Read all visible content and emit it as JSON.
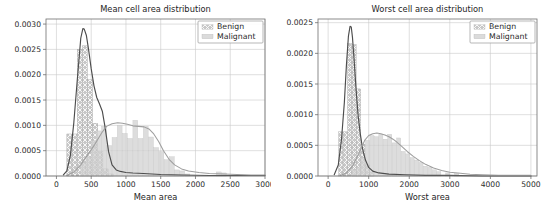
{
  "figure": {
    "background": "#ffffff",
    "grid": true,
    "legend_position": "upper right"
  },
  "colors": {
    "benign": "#9a9a9a",
    "benign_line": "#4d4d4d",
    "malignant": "#d2d2d2",
    "malignant_line": "#9e9e9e",
    "grid": "#c9c9c9",
    "axis": "#6f6f6f",
    "text": "#262626"
  },
  "legend": {
    "items": [
      {
        "label": "Benign",
        "color": "#9a9a9a",
        "hatch": "xx"
      },
      {
        "label": "Malignant",
        "color": "#d2d2d2",
        "hatch": ""
      }
    ]
  },
  "chart_data": [
    {
      "id": "mean-area",
      "type": "bar",
      "title": "Mean cell area distribution",
      "xlabel": "Mean area",
      "ylabel": "",
      "xlim": [
        -150,
        3000
      ],
      "ylim": [
        0.0,
        0.0031
      ],
      "xticks": [
        0,
        500,
        1000,
        1500,
        2000,
        2500,
        3000
      ],
      "xticklabels": [
        "0",
        "500",
        "1000",
        "1500",
        "2000",
        "2500",
        "3000"
      ],
      "yticks": [
        0.0,
        0.0005,
        0.001,
        0.0015,
        0.002,
        0.0025,
        0.003
      ],
      "yticklabels": [
        "0.0000",
        "0.0005",
        "0.0010",
        "0.0015",
        "0.0020",
        "0.0025",
        "0.0030"
      ],
      "bin_width": 75,
      "series": [
        {
          "name": "Benign",
          "kind": "histogram",
          "bin_starts": [
            150,
            225,
            300,
            375,
            450,
            525,
            600,
            675,
            750
          ],
          "values": [
            0.00083,
            0.00083,
            0.0025,
            0.00257,
            0.0019,
            0.00104,
            0.00048,
            0.00014,
            4e-05
          ],
          "kde_x": [
            100,
            150,
            200,
            250,
            300,
            350,
            380,
            400,
            430,
            460,
            500,
            540,
            580,
            620,
            660,
            700,
            750,
            800,
            860,
            920,
            1000,
            1100,
            1250,
            1500,
            1800,
            2200,
            2600,
            3000
          ],
          "kde_y": [
            2e-05,
            0.0001,
            0.0004,
            0.00105,
            0.0019,
            0.00272,
            0.00291,
            0.0029,
            0.00278,
            0.00252,
            0.00212,
            0.00178,
            0.00155,
            0.00142,
            0.00128,
            0.00096,
            0.00048,
            0.00022,
            0.00012,
            9e-05,
            7e-05,
            6e-05,
            5e-05,
            3e-05,
            2e-05,
            1e-05,
            1e-05,
            1e-05
          ]
        },
        {
          "name": "Malignant",
          "kind": "histogram",
          "bin_starts": [
            350,
            425,
            500,
            575,
            650,
            725,
            800,
            875,
            950,
            1025,
            1100,
            1175,
            1250,
            1325,
            1400,
            1475,
            1550,
            1625,
            1700,
            1775,
            1850,
            2300,
            2375
          ],
          "values": [
            0.00026,
            0.00038,
            0.0007,
            0.00089,
            0.00098,
            0.0006,
            0.00076,
            0.001,
            0.00084,
            0.00074,
            0.0011,
            0.00074,
            0.00098,
            0.00077,
            0.00056,
            0.00048,
            0.00032,
            0.00038,
            0.00012,
            0.0001,
            4e-05,
            8e-05,
            6e-05
          ],
          "kde_x": [
            150,
            250,
            350,
            450,
            550,
            650,
            720,
            800,
            880,
            950,
            1020,
            1100,
            1180,
            1260,
            1330,
            1400,
            1470,
            1540,
            1620,
            1700,
            1800,
            1900,
            2050,
            2200,
            2400,
            2600,
            2800,
            3000
          ],
          "kde_y": [
            1e-05,
            8e-05,
            0.00022,
            0.00042,
            0.00062,
            0.00085,
            0.00098,
            0.00103,
            0.00105,
            0.00104,
            0.00102,
            0.00099,
            0.00098,
            0.00097,
            0.00093,
            0.00083,
            0.00068,
            0.0005,
            0.00033,
            0.00022,
            0.00014,
            0.0001,
            7e-05,
            5e-05,
            4e-05,
            3e-05,
            2e-05,
            2e-05
          ]
        }
      ]
    },
    {
      "id": "worst-area",
      "type": "bar",
      "title": "Worst cell area distribution",
      "xlabel": "Worst area",
      "ylabel": "",
      "xlim": [
        -250,
        5150
      ],
      "ylim": [
        0.0,
        0.00256
      ],
      "xticks": [
        0,
        1000,
        2000,
        3000,
        4000,
        5000
      ],
      "xticklabels": [
        "0",
        "1000",
        "2000",
        "3000",
        "4000",
        "5000"
      ],
      "yticks": [
        0.0,
        0.0005,
        0.001,
        0.0015,
        0.002,
        0.0025
      ],
      "yticklabels": [
        "0.0000",
        "0.0005",
        "0.0010",
        "0.0015",
        "0.0020",
        "0.0025"
      ],
      "bin_width": 110,
      "series": [
        {
          "name": "Benign",
          "kind": "histogram",
          "bin_starts": [
            260,
            370,
            480,
            590,
            700,
            810,
            920,
            1030
          ],
          "values": [
            0.00072,
            0.00072,
            0.00216,
            0.00214,
            0.00142,
            0.00052,
            0.00018,
            6e-05
          ],
          "kde_x": [
            150,
            250,
            330,
            400,
            450,
            500,
            540,
            570,
            600,
            640,
            690,
            740,
            790,
            850,
            920,
            1000,
            1100,
            1250,
            1500,
            1900,
            2400,
            3000,
            3800,
            5000
          ],
          "kde_y": [
            2e-05,
            0.00018,
            0.0006,
            0.0012,
            0.0018,
            0.00228,
            0.00244,
            0.00243,
            0.00226,
            0.0019,
            0.0014,
            0.00098,
            0.0007,
            0.00044,
            0.00026,
            0.00014,
            8e-05,
            5e-05,
            3e-05,
            2e-05,
            1e-05,
            1e-05,
            0.0,
            0.0
          ]
        },
        {
          "name": "Malignant",
          "kind": "histogram",
          "bin_starts": [
            590,
            700,
            810,
            920,
            1030,
            1140,
            1250,
            1360,
            1470,
            1580,
            1690,
            1800,
            1910,
            2020,
            2130,
            2240,
            2350,
            2460,
            2570,
            2680,
            2900,
            3120
          ],
          "values": [
            0.0001,
            0.00014,
            0.0003,
            0.00058,
            0.00066,
            0.00064,
            0.00068,
            0.0006,
            0.00068,
            0.00054,
            0.00062,
            0.0004,
            0.00036,
            0.0003,
            0.00026,
            0.00022,
            0.00016,
            0.00014,
            0.0001,
            7e-05,
            5e-05,
            4e-05
          ],
          "kde_x": [
            300,
            450,
            600,
            750,
            900,
            1000,
            1100,
            1200,
            1300,
            1400,
            1500,
            1600,
            1700,
            1800,
            1950,
            2100,
            2250,
            2400,
            2600,
            2800,
            3000,
            3200,
            3500,
            3800,
            4200,
            4600,
            5000
          ],
          "kde_y": [
            1e-05,
            5e-05,
            0.00016,
            0.00036,
            0.00058,
            0.00066,
            0.00069,
            0.0007,
            0.00069,
            0.00067,
            0.00064,
            0.0006,
            0.00055,
            0.00049,
            0.0004,
            0.00032,
            0.00025,
            0.00019,
            0.00013,
            9e-05,
            6e-05,
            5e-05,
            3e-05,
            2e-05,
            1e-05,
            1e-05,
            1e-05
          ]
        }
      ]
    }
  ]
}
